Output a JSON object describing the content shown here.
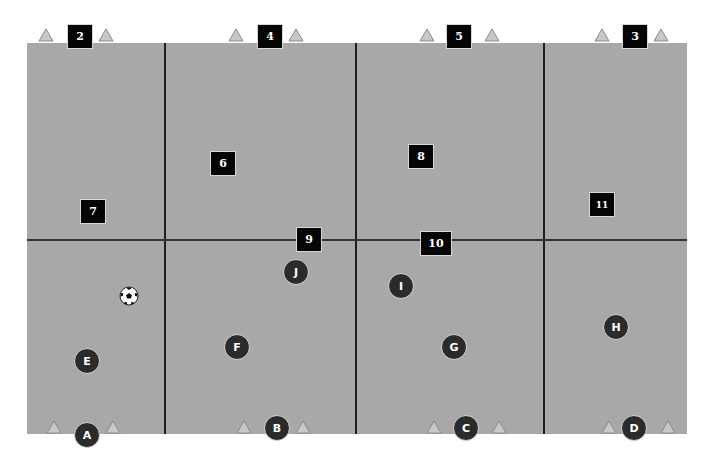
{
  "diagram": {
    "type": "soccer-training-field",
    "field_color": "#a8a8a8",
    "line_color": "#1e1e1e",
    "zones": {
      "columns": 4,
      "rows": 2
    },
    "top_markers": [
      {
        "label": "2",
        "x": 80,
        "y": 36
      },
      {
        "label": "4",
        "x": 270,
        "y": 36
      },
      {
        "label": "5",
        "x": 459,
        "y": 36
      },
      {
        "label": "3",
        "x": 635,
        "y": 36
      }
    ],
    "field_markers": [
      {
        "label": "6",
        "x": 223,
        "y": 163
      },
      {
        "label": "7",
        "x": 93,
        "y": 211
      },
      {
        "label": "8",
        "x": 421,
        "y": 156
      },
      {
        "label": "9",
        "x": 309,
        "y": 239
      },
      {
        "label": "10",
        "x": 436,
        "y": 243
      },
      {
        "label": "11",
        "x": 602,
        "y": 204
      }
    ],
    "players": [
      {
        "label": "A",
        "x": 87,
        "y": 435
      },
      {
        "label": "B",
        "x": 277,
        "y": 428
      },
      {
        "label": "C",
        "x": 466,
        "y": 428
      },
      {
        "label": "D",
        "x": 634,
        "y": 428
      },
      {
        "label": "E",
        "x": 87,
        "y": 361
      },
      {
        "label": "F",
        "x": 237,
        "y": 347
      },
      {
        "label": "G",
        "x": 454,
        "y": 347
      },
      {
        "label": "H",
        "x": 616,
        "y": 327
      },
      {
        "label": "I",
        "x": 401,
        "y": 286
      },
      {
        "label": "J",
        "x": 296,
        "y": 272
      }
    ],
    "ball": {
      "icon": "soccer-ball-icon",
      "x": 129,
      "y": 296
    },
    "cone_color": "#c8c8c8"
  }
}
